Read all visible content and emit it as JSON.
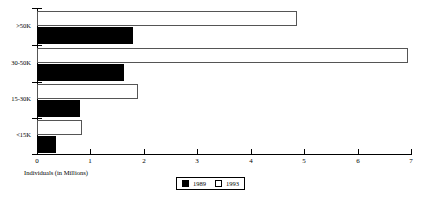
{
  "chart_data": {
    "type": "bar",
    "orientation": "horizontal",
    "title": "",
    "xlabel": "Individuals (in Millions)",
    "ylabel": "",
    "categories": [
      ">50K",
      "30-50K",
      "15-30K",
      "<15K"
    ],
    "series": [
      {
        "name": "1989",
        "color": "#000000",
        "values": [
          1.8,
          1.63,
          0.8,
          0.35
        ]
      },
      {
        "name": "1993",
        "color": "#ffffff",
        "values": [
          4.86,
          6.95,
          1.89,
          0.85
        ]
      }
    ],
    "xlim": [
      0,
      7
    ],
    "xticks": [
      "0",
      "1",
      "2",
      "3",
      "4",
      "5",
      "6",
      "7"
    ],
    "grid": false,
    "legend_position": "bottom-center",
    "legend_entries": [
      {
        "label": "1989",
        "swatch": "filled-black"
      },
      {
        "label": "1993",
        "swatch": "open-white"
      }
    ]
  },
  "colors": {
    "axis": "#000000",
    "series_1989": "#000000",
    "series_1993": "#ffffff",
    "series_1993_outline": "#555555",
    "background": "#ffffff"
  }
}
